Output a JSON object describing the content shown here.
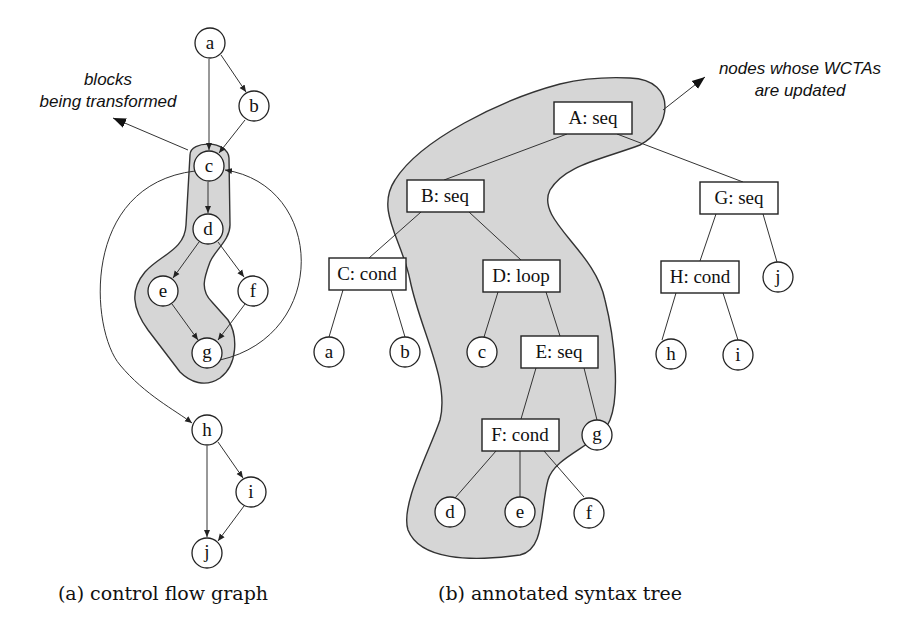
{
  "colors": {
    "background": "#ffffff",
    "highlight_region": "#d6d6d6",
    "stroke": "#222222"
  },
  "figure_a": {
    "caption": "(a) control flow graph",
    "annotation": {
      "line1": "blocks",
      "line2": "being transformed"
    },
    "nodes": [
      {
        "id": "a",
        "label": "a"
      },
      {
        "id": "b",
        "label": "b"
      },
      {
        "id": "c",
        "label": "c"
      },
      {
        "id": "d",
        "label": "d"
      },
      {
        "id": "e",
        "label": "e"
      },
      {
        "id": "f",
        "label": "f"
      },
      {
        "id": "g",
        "label": "g"
      },
      {
        "id": "h",
        "label": "h"
      },
      {
        "id": "i",
        "label": "i"
      },
      {
        "id": "j",
        "label": "j"
      }
    ],
    "edges": [
      [
        "a",
        "b"
      ],
      [
        "a",
        "c"
      ],
      [
        "b",
        "c"
      ],
      [
        "c",
        "d"
      ],
      [
        "d",
        "e"
      ],
      [
        "d",
        "f"
      ],
      [
        "e",
        "g"
      ],
      [
        "f",
        "g"
      ],
      [
        "g",
        "c"
      ],
      [
        "c",
        "h"
      ],
      [
        "h",
        "i"
      ],
      [
        "h",
        "j"
      ],
      [
        "i",
        "j"
      ]
    ],
    "highlighted_blocks": [
      "c",
      "d",
      "e",
      "g"
    ]
  },
  "figure_b": {
    "caption": "(b) annotated syntax tree",
    "annotation": {
      "line1": "nodes whose WCTAs",
      "line2": "are updated"
    },
    "internal_nodes": [
      {
        "id": "A",
        "label": "A: seq"
      },
      {
        "id": "B",
        "label": "B: seq"
      },
      {
        "id": "C",
        "label": "C: cond"
      },
      {
        "id": "D",
        "label": "D: loop"
      },
      {
        "id": "E",
        "label": "E: seq"
      },
      {
        "id": "F",
        "label": "F: cond"
      },
      {
        "id": "G",
        "label": "G: seq"
      },
      {
        "id": "H",
        "label": "H: cond"
      }
    ],
    "leaves": [
      {
        "id": "a",
        "label": "a"
      },
      {
        "id": "b",
        "label": "b"
      },
      {
        "id": "c",
        "label": "c"
      },
      {
        "id": "g",
        "label": "g"
      },
      {
        "id": "d",
        "label": "d"
      },
      {
        "id": "e",
        "label": "e"
      },
      {
        "id": "f",
        "label": "f"
      },
      {
        "id": "h",
        "label": "h"
      },
      {
        "id": "i",
        "label": "i"
      },
      {
        "id": "j",
        "label": "j"
      }
    ],
    "tree_edges": [
      [
        "A",
        "B"
      ],
      [
        "A",
        "G"
      ],
      [
        "B",
        "C"
      ],
      [
        "B",
        "D"
      ],
      [
        "C",
        "a"
      ],
      [
        "C",
        "b"
      ],
      [
        "D",
        "c"
      ],
      [
        "D",
        "E"
      ],
      [
        "E",
        "F"
      ],
      [
        "E",
        "g"
      ],
      [
        "F",
        "d"
      ],
      [
        "F",
        "e"
      ],
      [
        "F",
        "f"
      ],
      [
        "G",
        "H"
      ],
      [
        "G",
        "j"
      ],
      [
        "H",
        "h"
      ],
      [
        "H",
        "i"
      ]
    ],
    "highlighted_nodes": [
      "A",
      "B",
      "D",
      "E",
      "F",
      "c",
      "g",
      "d",
      "e"
    ]
  }
}
